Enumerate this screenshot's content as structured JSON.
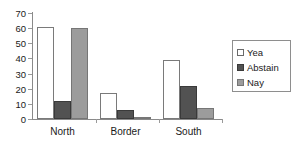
{
  "chart_data": {
    "type": "bar",
    "title": "",
    "xlabel": "",
    "ylabel": "",
    "ylim": [
      0,
      70
    ],
    "yticks": [
      0,
      10,
      20,
      30,
      40,
      50,
      60,
      70
    ],
    "grid": false,
    "legend_position": "right",
    "categories": [
      "North",
      "Border",
      "South"
    ],
    "series": [
      {
        "name": "Yea",
        "color": "#ffffff",
        "values": [
          61,
          17,
          39
        ]
      },
      {
        "name": "Abstain",
        "color": "#525252",
        "values": [
          12,
          6,
          22
        ]
      },
      {
        "name": "Nay",
        "color": "#9c9c9c",
        "values": [
          60,
          1,
          7
        ]
      }
    ]
  },
  "axis": {
    "y_tick_labels": [
      "0",
      "10",
      "20",
      "30",
      "40",
      "50",
      "60",
      "70"
    ]
  },
  "legend": {
    "items": [
      {
        "label": "Yea"
      },
      {
        "label": "Abstain"
      },
      {
        "label": "Nay"
      }
    ]
  }
}
